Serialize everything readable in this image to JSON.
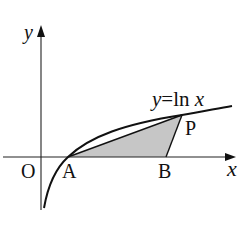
{
  "diagram": {
    "equation_label": "y=ln x",
    "equation_parts": {
      "y": "y",
      "eq": "=",
      "ln": "ln",
      "x": "x"
    },
    "axis_labels": {
      "x": "x",
      "y": "y"
    },
    "origin_label": "O",
    "points": {
      "A": "A",
      "B": "B",
      "P": "P"
    },
    "colors": {
      "stroke": "#111111",
      "shade": "#c8c8c8",
      "background": "#ffffff"
    }
  }
}
